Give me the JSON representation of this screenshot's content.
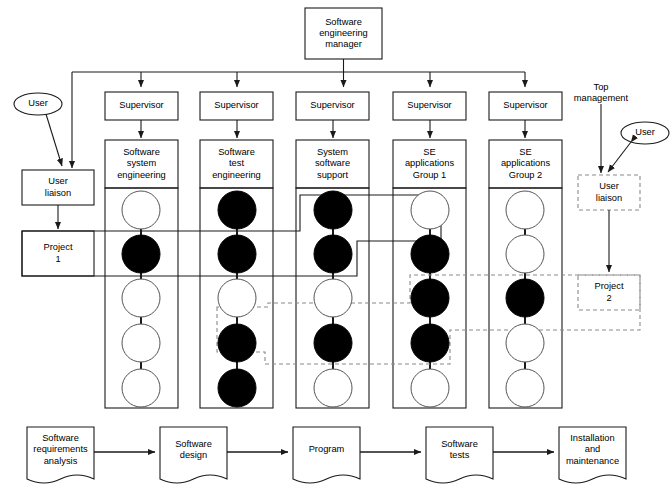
{
  "diagram": {
    "title_box": {
      "label": "Software\nengineering\nmanager"
    },
    "supervisors": [
      {
        "label": "Supervisor"
      },
      {
        "label": "Supervisor"
      },
      {
        "label": "Supervisor"
      },
      {
        "label": "Supervisor"
      },
      {
        "label": "Supervisor"
      }
    ],
    "departments": [
      {
        "label": "Software\nsystem\nengineering"
      },
      {
        "label": "Software\ntest\nengineering"
      },
      {
        "label": "System\nsoftware\nsupport"
      },
      {
        "label": "SE\napplications\nGroup 1"
      },
      {
        "label": "SE\napplications\nGroup 2"
      }
    ],
    "left_side": {
      "user_label": "User",
      "liaison_label": "User\nliaison",
      "project_label": "Project\n1"
    },
    "right_side": {
      "top_management_label": "Top\nmanagement",
      "user_label": "User",
      "liaison_label": "User\nliaison",
      "project_label": "Project\n2"
    },
    "staff_columns": [
      {
        "department": "Software system engineering",
        "circles": [
          "white",
          "black",
          "white",
          "white",
          "white"
        ]
      },
      {
        "department": "Software test engineering",
        "circles": [
          "black",
          "black",
          "white",
          "black",
          "black"
        ]
      },
      {
        "department": "System software support",
        "circles": [
          "black",
          "black",
          "white",
          "black",
          "white"
        ]
      },
      {
        "department": "SE applications Group 1",
        "circles": [
          "white",
          "black",
          "black",
          "black",
          "white"
        ]
      },
      {
        "department": "SE applications Group 2",
        "circles": [
          "white",
          "white",
          "black",
          "white",
          "white"
        ]
      }
    ],
    "process_flow": [
      {
        "label": "Software\nrequirements\nanalysis"
      },
      {
        "label": "Software\ndesign"
      },
      {
        "label": "Program"
      },
      {
        "label": "Software\ntests"
      },
      {
        "label": "Installation\nand\nmaintenance"
      }
    ],
    "colors": {
      "line": "#1a1a1a",
      "fill_assigned": "#000000",
      "fill_unassigned": "#ffffff",
      "dashed": "#8a8a8a",
      "background": "#ffffff"
    },
    "legend_semantics": {
      "black_circle": "assigned staff member",
      "white_circle": "unassigned staff member",
      "solid_boundary": "Project 1 team boundary",
      "dashed_boundary": "Project 2 team boundary"
    }
  }
}
